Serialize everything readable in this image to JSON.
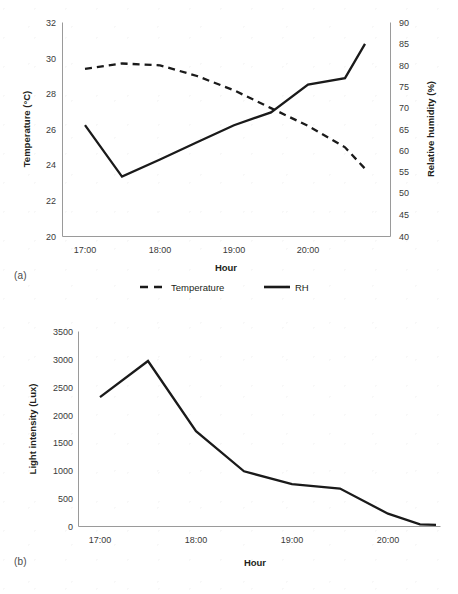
{
  "page": {
    "background": "#ffffff",
    "line_color": "#1a1a1a",
    "axis_color": "#9a9a9a"
  },
  "figure_a": {
    "panel_label": "(a)",
    "xlabel": "Hour",
    "ylabel_left": "Temperature (°C)",
    "ylabel_right": "Relative humidity (%)",
    "x_ticks": [
      "17:00",
      "18:00",
      "19:00",
      "20:00"
    ],
    "y_ticks_left": [
      "32",
      "30",
      "28",
      "26",
      "24",
      "22",
      "20"
    ],
    "y_ticks_right": [
      "90",
      "85",
      "80",
      "75",
      "70",
      "65",
      "60",
      "55",
      "50",
      "45",
      "40"
    ],
    "legend": [
      {
        "label": "Temperature",
        "style": "dashed"
      },
      {
        "label": "RH",
        "style": "solid"
      }
    ]
  },
  "figure_b": {
    "panel_label": "(b)",
    "xlabel": "Hour",
    "ylabel": "Light intensity (Lux)",
    "x_ticks": [
      "17:00",
      "18:00",
      "19:00",
      "20:00"
    ],
    "y_ticks": [
      "3500",
      "3000",
      "2500",
      "2000",
      "1500",
      "1000",
      "500",
      "0"
    ]
  },
  "chart_data": [
    {
      "type": "line",
      "id": "figure-a",
      "title": "",
      "xlabel": "Hour",
      "ylabel": "Temperature (°C)",
      "ylabel_secondary": "Relative humidity (%)",
      "x": [
        "17:00",
        "17:30",
        "18:00",
        "18:30",
        "19:00",
        "19:30",
        "20:00",
        "20:30",
        "20:45"
      ],
      "xlim": [
        "17:00",
        "20:45"
      ],
      "ylim": [
        20,
        32
      ],
      "ylim_secondary": [
        40,
        90
      ],
      "grid": false,
      "legend_position": "bottom",
      "series": [
        {
          "name": "Temperature",
          "axis": "left",
          "units": "°C",
          "style": "dashed",
          "values": [
            29.4,
            29.7,
            29.6,
            29.0,
            28.2,
            27.2,
            26.2,
            25.0,
            23.8
          ]
        },
        {
          "name": "RH",
          "axis": "right",
          "units": "%",
          "style": "solid",
          "values": [
            66,
            54,
            58,
            62,
            66,
            69,
            75.5,
            77,
            85
          ]
        }
      ]
    },
    {
      "type": "line",
      "id": "figure-b",
      "title": "",
      "xlabel": "Hour",
      "ylabel": "Light intensity (Lux)",
      "x": [
        "17:00",
        "17:30",
        "18:00",
        "18:30",
        "19:00",
        "19:30",
        "20:00",
        "20:30",
        "20:45"
      ],
      "xlim": [
        "17:00",
        "20:45"
      ],
      "ylim": [
        0,
        3500
      ],
      "grid": false,
      "legend_position": "none",
      "series": [
        {
          "name": "Light intensity",
          "axis": "left",
          "units": "Lux",
          "style": "solid",
          "values": [
            2320,
            2970,
            1710,
            990,
            760,
            680,
            230,
            40,
            30
          ]
        }
      ]
    }
  ]
}
